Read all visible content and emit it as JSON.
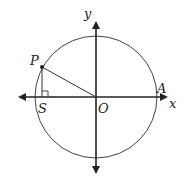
{
  "diagram": {
    "type": "unit-circle",
    "labels": {
      "y_axis": "y",
      "x_axis": "x",
      "point_p": "P",
      "point_s": "S",
      "origin": "O",
      "point_a": "A"
    },
    "colors": {
      "stroke": "#222222",
      "circle": "#444444",
      "background": "#ffffff"
    }
  }
}
